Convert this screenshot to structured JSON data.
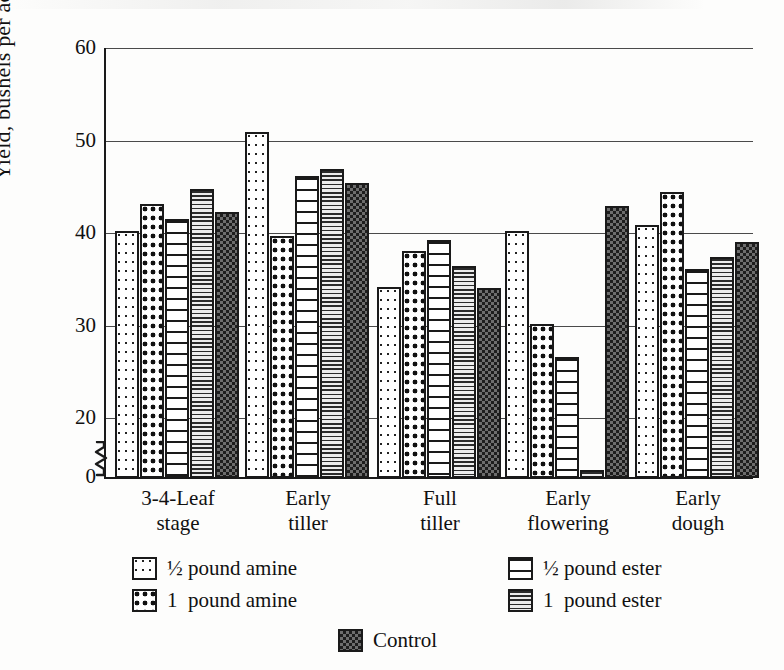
{
  "chart_data": {
    "type": "bar",
    "title": "",
    "xlabel": "",
    "ylabel": "Yield, bushels per acre",
    "ylim": [
      0,
      60
    ],
    "yticks": [
      0,
      20,
      30,
      40,
      50,
      60
    ],
    "ytick_labels": [
      "0",
      "20",
      "30",
      "40",
      "50",
      "60"
    ],
    "axis_break": true,
    "grid": true,
    "legend_position": "below",
    "categories": [
      "3-4-Leaf\nstage",
      "Early\ntiller",
      "Full\ntiller",
      "Early\nflowering",
      "Early\ndough"
    ],
    "category_lines": [
      [
        "3-4-Leaf",
        "stage"
      ],
      [
        "Early",
        "tiller"
      ],
      [
        "Full",
        "tiller"
      ],
      [
        "Early",
        "flowering"
      ],
      [
        "Early",
        "dough"
      ]
    ],
    "series": [
      {
        "name": "½ pound amine",
        "pattern": "light-dots",
        "values": [
          40.4,
          51.0,
          34.3,
          40.3,
          41.0
        ]
      },
      {
        "name": "1  pound amine",
        "pattern": "heavy-dots",
        "values": [
          43.3,
          39.8,
          38.2,
          30.3,
          44.6
        ]
      },
      {
        "name": "½ pound ester",
        "pattern": "wide-stripes",
        "values": [
          41.7,
          46.3,
          39.4,
          26.7,
          36.2
        ]
      },
      {
        "name": "1  pound ester",
        "pattern": "fine-stripes",
        "values": [
          44.9,
          47.0,
          36.6,
          3.7,
          37.5
        ]
      },
      {
        "name": "Control",
        "pattern": "checker",
        "values": [
          42.4,
          45.5,
          34.2,
          43.1,
          39.2
        ]
      }
    ]
  },
  "legend": {
    "entries": [
      {
        "label": "½ pound amine",
        "pattern": "light-dots",
        "column": "left",
        "row": 0
      },
      {
        "label": "1  pound amine",
        "pattern": "heavy-dots",
        "column": "left",
        "row": 1
      },
      {
        "label": "½ pound ester",
        "pattern": "wide-stripes",
        "column": "right",
        "row": 0
      },
      {
        "label": "1  pound ester",
        "pattern": "fine-stripes",
        "column": "right",
        "row": 1
      },
      {
        "label": "Control",
        "pattern": "checker",
        "column": "center",
        "row": 2
      }
    ]
  },
  "colors": {
    "ink": "#1a1a1a",
    "grid": "#4a4a4a",
    "paper": "#fdfdfc",
    "control_fill": "#6d6d6d"
  }
}
